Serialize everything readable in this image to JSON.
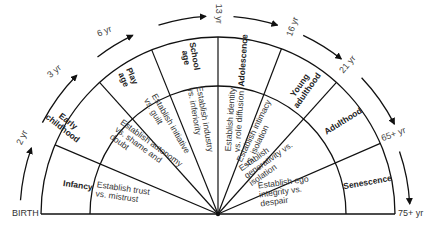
{
  "geometry": {
    "center": [
      218,
      214
    ],
    "inner_radius": 128,
    "outer_radius": 177,
    "arrow_radius": 198,
    "divider_angles_deg": [
      180,
      157,
      132,
      112,
      90,
      69,
      48,
      23.5,
      0
    ],
    "line_color": "#111111"
  },
  "baseline_labels": {
    "start": "BIRTH",
    "end": "75+  yr"
  },
  "age_markers": [
    {
      "label": "2 yr",
      "x": 22,
      "y": 137,
      "rot": -65
    },
    {
      "label": "3 yr",
      "x": 54,
      "y": 71,
      "rot": -40
    },
    {
      "label": "6 yr",
      "x": 104,
      "y": 31,
      "rot": -22
    },
    {
      "label": "13 yr",
      "x": 218,
      "y": 13,
      "rot": 90
    },
    {
      "label": "16 yr",
      "x": 293,
      "y": 26,
      "rot": -70
    },
    {
      "label": "21 yr",
      "x": 348,
      "y": 64,
      "rot": -50
    },
    {
      "label": "65+  yr",
      "x": 393,
      "y": 134,
      "rot": -20
    }
  ],
  "stages": [
    {
      "name": "Infancy",
      "task": "Establish trust\nvs. mistrust",
      "name_pos": [
        78,
        185,
        8
      ],
      "task_pos": [
        122,
        193,
        8
      ]
    },
    {
      "name": "Early\nchildhood",
      "task": "Establish autonomy\nvs. shame and\ndoubt",
      "name_pos": [
        65,
        125,
        38
      ],
      "task_pos": [
        146,
        150,
        36
      ]
    },
    {
      "name": "Play\nage",
      "task": "Establish initiative\nvs. guilt",
      "name_pos": [
        128,
        78,
        66
      ],
      "task_pos": [
        167,
        126,
        60
      ]
    },
    {
      "name": "School\nage",
      "task": "Establish industry\nvs. inferiority",
      "name_pos": [
        190,
        57,
        80
      ],
      "task_pos": [
        200,
        120,
        80
      ]
    },
    {
      "name": "Adolescence",
      "task": "Establish identity\nvs. role diffusion",
      "name_pos": [
        243,
        60,
        -86
      ],
      "task_pos": [
        235,
        120,
        -86
      ]
    },
    {
      "name": "Young\nadulthood",
      "task": "Establish intimacy\nvs. isolation",
      "name_pos": [
        303,
        88,
        -55
      ],
      "task_pos": [
        258,
        133,
        -64
      ]
    },
    {
      "name": "Adulthood",
      "task": "Establish\ngenerativity vs.\nisolation",
      "name_pos": [
        343,
        121,
        -32
      ],
      "task_pos": [
        268,
        160,
        -35
      ]
    },
    {
      "name": "Senescence",
      "task": "Establish ego\nintegrity vs.\ndespair",
      "name_pos": [
        367,
        182,
        -10
      ],
      "task_pos": [
        284,
        191,
        -8
      ]
    }
  ]
}
